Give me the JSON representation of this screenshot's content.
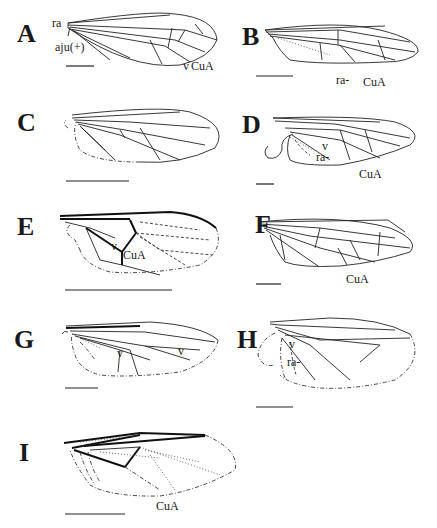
{
  "figure": {
    "panels": [
      {
        "id": "A",
        "letter": "A",
        "labels": [
          "ra",
          "aju(+)",
          "v",
          "CuA"
        ]
      },
      {
        "id": "B",
        "letter": "B",
        "labels": [
          "ra-",
          "CuA"
        ]
      },
      {
        "id": "C",
        "letter": "C",
        "labels": [
          "v"
        ]
      },
      {
        "id": "D",
        "letter": "D",
        "labels": [
          "v",
          "ra-",
          "CuA"
        ]
      },
      {
        "id": "E",
        "letter": "E",
        "labels": [
          "v",
          "CuA"
        ]
      },
      {
        "id": "F",
        "letter": "F",
        "labels": [
          "v",
          "CuA"
        ]
      },
      {
        "id": "G",
        "letter": "G",
        "labels": [
          "v",
          "v"
        ]
      },
      {
        "id": "H",
        "letter": "H",
        "labels": [
          "v",
          "ra-"
        ]
      },
      {
        "id": "I",
        "letter": "I",
        "labels": [
          "CuA"
        ]
      }
    ]
  }
}
